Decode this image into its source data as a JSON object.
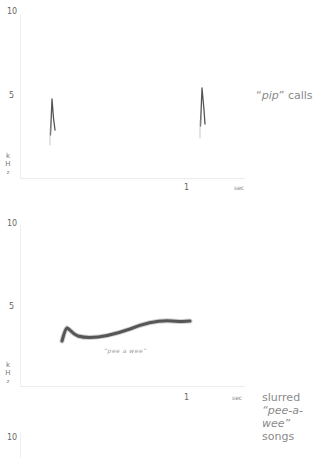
{
  "panels": [
    {
      "id": "pip",
      "y_ticks": [
        "10",
        "5"
      ],
      "y_unit": [
        "k",
        "H",
        "z"
      ],
      "x_tick": "1",
      "x_unit": "sec",
      "caption": {
        "quote_open": "“",
        "italic": "pip",
        "quote_close": "”",
        "rest": " calls"
      }
    },
    {
      "id": "pee-a-wee",
      "y_ticks": [
        "10",
        "5"
      ],
      "y_unit": [
        "k",
        "H",
        "z"
      ],
      "x_tick": "1",
      "x_unit": "sec",
      "trace_label": "“pee a wee”",
      "caption": {
        "line1": "slurred",
        "line2": "“pee-a-wee”",
        "line3": "songs"
      }
    },
    {
      "id": "third",
      "y_ticks": [
        "10"
      ]
    }
  ]
}
